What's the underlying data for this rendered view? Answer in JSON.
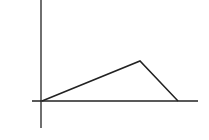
{
  "diagram": {
    "type": "piecewise-linear-graph",
    "stroke_color": "#222222",
    "background": "#ffffff",
    "y_axis": {
      "x": 41,
      "y1": 0,
      "y2": 128
    },
    "x_axis": {
      "y": 101,
      "x1": 32,
      "x2": 198
    },
    "polyline": [
      {
        "x": 42,
        "y": 101
      },
      {
        "x": 140,
        "y": 61
      },
      {
        "x": 178,
        "y": 101
      }
    ]
  }
}
